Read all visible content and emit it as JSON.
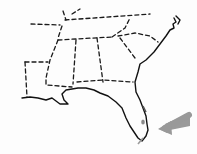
{
  "map": {
    "title": "Southeastern United States sketch map",
    "region": "Southeastern United States",
    "highlight": "South Florida",
    "style": {
      "border_color": "#1a1a1a",
      "coast_color": "#111111",
      "arrow_color": "#9a9a9a",
      "lake_color": "#8a8a8a",
      "background": "#fdfdfd"
    },
    "features": [
      {
        "name": "state-borders",
        "type": "dashed-lines"
      },
      {
        "name": "coastline",
        "type": "solid-line"
      },
      {
        "name": "pointer-arrow",
        "type": "arrow",
        "points_to": "South Florida"
      }
    ]
  }
}
